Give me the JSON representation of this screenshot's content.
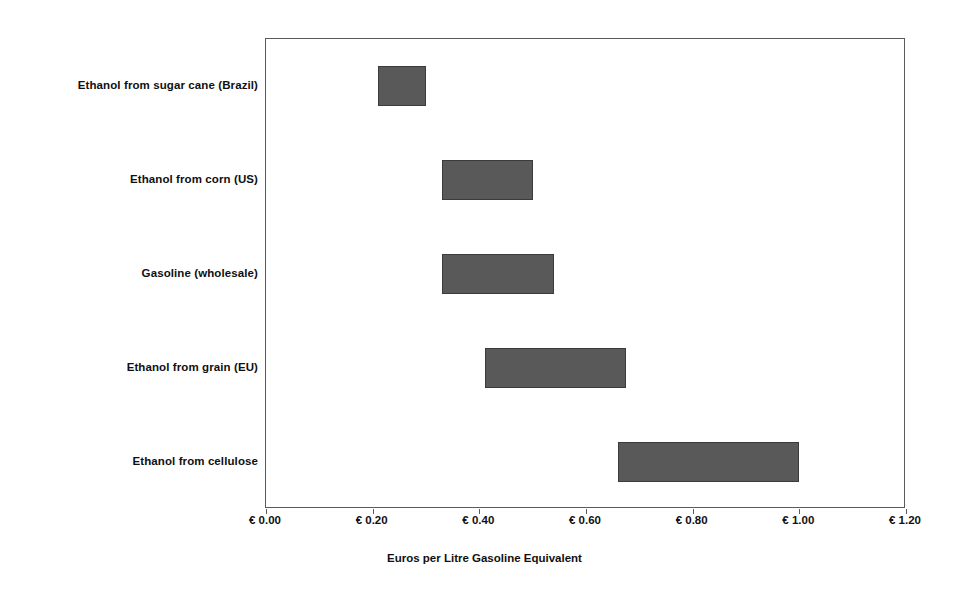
{
  "chart_data": {
    "type": "bar",
    "orientation": "horizontal",
    "subtype": "floating-range-bar",
    "title": "",
    "xlabel": "Euros per Litre Gasoline Equivalent",
    "ylabel": "",
    "xlim": [
      0.0,
      1.2
    ],
    "grid": false,
    "legend": false,
    "currency_symbol": "€",
    "bar_color": "#595959",
    "frame_color": "#5a5a5a",
    "categories": [
      "Ethanol from sugar cane (Brazil)",
      "Ethanol from corn (US)",
      "Gasoline (wholesale)",
      "Ethanol from grain (EU)",
      "Ethanol from cellulose"
    ],
    "ranges": [
      {
        "category": "Ethanol from sugar cane (Brazil)",
        "low": 0.21,
        "high": 0.3
      },
      {
        "category": "Ethanol from corn (US)",
        "low": 0.33,
        "high": 0.5
      },
      {
        "category": "Gasoline (wholesale)",
        "low": 0.33,
        "high": 0.54
      },
      {
        "category": "Ethanol from grain (EU)",
        "low": 0.41,
        "high": 0.675
      },
      {
        "category": "Ethanol from cellulose",
        "low": 0.66,
        "high": 1.0
      }
    ],
    "xticks": [
      0.0,
      0.2,
      0.4,
      0.6,
      0.8,
      1.0,
      1.2
    ],
    "xtick_labels": [
      "€ 0.00",
      "€ 0.20",
      "€ 0.40",
      "€ 0.60",
      "€ 0.80",
      "€ 1.00",
      "€ 1.20"
    ]
  }
}
